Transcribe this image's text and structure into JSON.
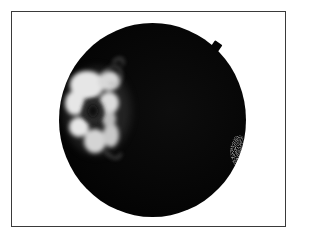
{
  "image": {
    "description": "Fundus fluorescein angiogram in a bordered frame",
    "subject": "retina",
    "features": [
      {
        "name": "hyperfluorescent-lesion",
        "position": "left-center",
        "appearance": "bright petaloid white patches around dark center"
      },
      {
        "name": "edge-notch",
        "position": "top-right rim"
      },
      {
        "name": "speckled-hyperfluorescence",
        "position": "right rim"
      }
    ],
    "colors": {
      "background": "#ffffff",
      "frame_border": "#3a3a3a",
      "fundus": "#000000",
      "lesion_bright": "#e8e8e8"
    }
  }
}
